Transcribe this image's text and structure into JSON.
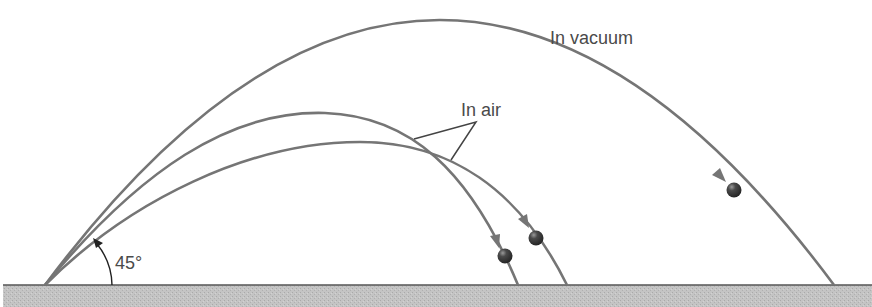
{
  "diagram": {
    "labels": {
      "vacuum": "In vacuum",
      "air": "In air",
      "angle": "45°"
    },
    "launch_angle_deg": 45,
    "colors": {
      "trajectory": "#757575",
      "ball": "#3a3a3a",
      "ground_fill": "#bdbdbd",
      "ground_line": "#555555",
      "text": "#4a4a4a",
      "annotation_arrow": "#222222"
    },
    "trajectories": [
      {
        "name": "vacuum",
        "label": "In vacuum",
        "launch": [
          45,
          285
        ],
        "apex": [
          440,
          20
        ],
        "landing": [
          834,
          285
        ],
        "ball": [
          734,
          190
        ]
      },
      {
        "name": "air-high",
        "label": "In air",
        "launch": [
          45,
          285
        ],
        "apex": [
          325,
          113
        ],
        "landing": [
          518,
          285
        ],
        "ball": [
          505,
          256
        ]
      },
      {
        "name": "air-low",
        "label": "In air",
        "launch": [
          45,
          285
        ],
        "apex": [
          360,
          142
        ],
        "landing": [
          567,
          285
        ],
        "ball": [
          536,
          238
        ]
      }
    ]
  }
}
